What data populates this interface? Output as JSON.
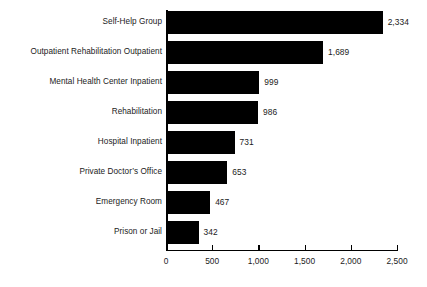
{
  "chart_data": {
    "type": "bar",
    "orientation": "horizontal",
    "title": "",
    "subtitle": "",
    "xlabel": "",
    "ylabel": "",
    "xlim": [
      0,
      2500
    ],
    "xticks": [
      0,
      500,
      1000,
      1500,
      2000,
      2500
    ],
    "xtick_labels": [
      "0",
      "500",
      "1,000",
      "1,500",
      "2,000",
      "2,500"
    ],
    "grid": false,
    "legend": null,
    "bar_color": "#000000",
    "text_color": "#1b1b1b",
    "background_color": "#ffffff",
    "categories": [
      "Self-Help Group",
      "Outpatient Rehabilitation Outpatient",
      "Mental Health Center Inpatient",
      "Rehabilitation",
      "Hospital Inpatient",
      "Private Doctor’s Office",
      "Emergency Room",
      "Prison or Jail"
    ],
    "values": [
      2334,
      1689,
      999,
      986,
      731,
      653,
      467,
      342
    ],
    "value_labels": [
      "2,334",
      "1,689",
      "999",
      "986",
      "731",
      "653",
      "467",
      "342"
    ]
  }
}
